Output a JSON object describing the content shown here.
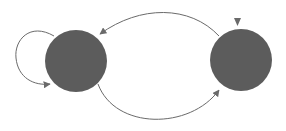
{
  "diagram": {
    "type": "state-diagram",
    "colors": {
      "node_fill": "#5c5c5c",
      "edge": "#6a6a6a",
      "background": "#ffffff"
    },
    "nodes": [
      {
        "id": "left-state",
        "cx": 76,
        "cy": 61,
        "r": 31
      },
      {
        "id": "right-state",
        "cx": 241,
        "cy": 60,
        "r": 31,
        "initial": true
      }
    ],
    "edges": [
      {
        "from": "right-state",
        "to": "left-state",
        "label": ""
      },
      {
        "from": "left-state",
        "to": "right-state",
        "label": ""
      },
      {
        "from": "left-state",
        "to": "left-state",
        "label": "",
        "self_loop": true
      }
    ]
  }
}
